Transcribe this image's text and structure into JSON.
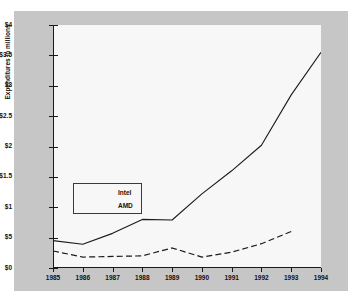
{
  "chart_data": {
    "type": "line",
    "title": "",
    "xlabel": "",
    "ylabel": "Expenditures in millions",
    "x": [
      1985,
      1986,
      1987,
      1988,
      1989,
      1990,
      1991,
      1992,
      1993,
      1994
    ],
    "xtick_labels": [
      "1985",
      "1986",
      "1987",
      "1988",
      "1989",
      "1990",
      "1991",
      "1992",
      "1993",
      "1994"
    ],
    "xlim": [
      1985,
      1994
    ],
    "ylim": [
      0,
      4
    ],
    "ytick_values": [
      0,
      0.5,
      1,
      1.5,
      2,
      2.5,
      3,
      3.5,
      4
    ],
    "ytick_labels": [
      "$0",
      "$5",
      "$1",
      "$1.5",
      "$2",
      "$2.5",
      "$3",
      "$3.5",
      "$4"
    ],
    "grid": false,
    "legend_position": "center-left",
    "series": [
      {
        "name": "Intel",
        "style": "solid",
        "color": "#1a1a1a",
        "x": [
          1985,
          1986,
          1987,
          1988,
          1989,
          1990,
          1991,
          1992,
          1993,
          1994
        ],
        "values": [
          0.45,
          0.39,
          0.57,
          0.8,
          0.79,
          1.22,
          1.6,
          2.02,
          2.85,
          3.55
        ]
      },
      {
        "name": "AMD",
        "style": "dashed",
        "color": "#1a1a1a",
        "x": [
          1985,
          1986,
          1987,
          1988,
          1989,
          1990,
          1991,
          1992,
          1993
        ],
        "values": [
          0.28,
          0.18,
          0.19,
          0.2,
          0.33,
          0.18,
          0.26,
          0.4,
          0.6
        ]
      }
    ]
  },
  "figure": {
    "panel_color": "#c6c6c6",
    "plot_bg_color": "#f7f7f7",
    "axis_color": "#1a1a1a"
  },
  "legend": {
    "entries": [
      {
        "label": "Intel",
        "style": "solid"
      },
      {
        "label": "AMD",
        "style": "dashed"
      }
    ]
  }
}
